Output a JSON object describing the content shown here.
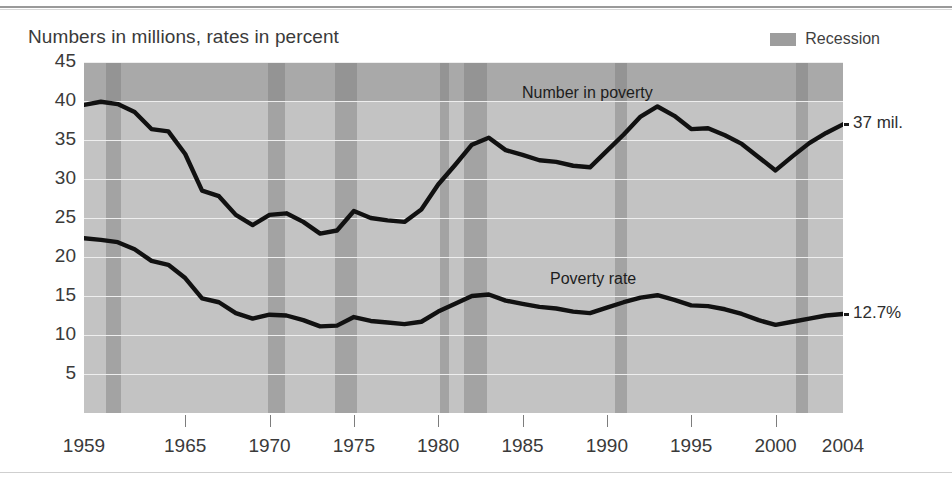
{
  "figure": {
    "subtitle": "Numbers in millions, rates in percent"
  },
  "legend": {
    "recession_label": "Recession",
    "recession_color": "#9d9d9d"
  },
  "annotations": {
    "number_in_poverty": "Number in poverty",
    "poverty_rate": "Poverty rate",
    "end_number": "37 mil.",
    "end_rate": "12.7%"
  },
  "chart_data": {
    "type": "line",
    "title": "",
    "subtitle": "Numbers in millions, rates in percent",
    "xlabel": "",
    "ylabel": "",
    "xlim": [
      1959,
      2004
    ],
    "ylim": [
      0,
      45
    ],
    "grid": true,
    "legend_position": "top-right",
    "y_ticks": [
      45,
      40,
      35,
      30,
      25,
      20,
      15,
      10,
      5
    ],
    "x_ticks": [
      1959,
      1965,
      1970,
      1975,
      1980,
      1985,
      1990,
      1995,
      2000,
      2004
    ],
    "x": [
      1959,
      1960,
      1961,
      1962,
      1963,
      1964,
      1965,
      1966,
      1967,
      1968,
      1969,
      1970,
      1971,
      1972,
      1973,
      1974,
      1975,
      1976,
      1977,
      1978,
      1979,
      1980,
      1981,
      1982,
      1983,
      1984,
      1985,
      1986,
      1987,
      1988,
      1989,
      1990,
      1991,
      1992,
      1993,
      1994,
      1995,
      1996,
      1997,
      1998,
      1999,
      2000,
      2001,
      2002,
      2003,
      2004
    ],
    "series": [
      {
        "name": "Number in poverty",
        "units": "millions",
        "end_value_label": "37 mil.",
        "values": [
          39.5,
          39.9,
          39.6,
          38.6,
          36.4,
          36.1,
          33.2,
          28.5,
          27.8,
          25.4,
          24.1,
          25.4,
          25.6,
          24.5,
          23.0,
          23.4,
          25.9,
          25.0,
          24.7,
          24.5,
          26.1,
          29.3,
          31.8,
          34.4,
          35.3,
          33.7,
          33.1,
          32.4,
          32.2,
          31.7,
          31.5,
          33.6,
          35.7,
          38.0,
          39.3,
          38.1,
          36.4,
          36.5,
          35.6,
          34.5,
          32.8,
          31.1,
          32.9,
          34.6,
          35.9,
          37.0
        ]
      },
      {
        "name": "Poverty rate",
        "units": "percent",
        "end_value_label": "12.7%",
        "values": [
          22.4,
          22.2,
          21.9,
          21.0,
          19.5,
          19.0,
          17.3,
          14.7,
          14.2,
          12.8,
          12.1,
          12.6,
          12.5,
          11.9,
          11.1,
          11.2,
          12.3,
          11.8,
          11.6,
          11.4,
          11.7,
          13.0,
          14.0,
          15.0,
          15.2,
          14.4,
          14.0,
          13.6,
          13.4,
          13.0,
          12.8,
          13.5,
          14.2,
          14.8,
          15.1,
          14.5,
          13.8,
          13.7,
          13.3,
          12.7,
          11.9,
          11.3,
          11.7,
          12.1,
          12.5,
          12.7
        ]
      }
    ],
    "recessions": [
      {
        "start": 1960.3,
        "end": 1961.2
      },
      {
        "start": 1969.9,
        "end": 1970.9
      },
      {
        "start": 1973.9,
        "end": 1975.2
      },
      {
        "start": 1980.1,
        "end": 1980.6
      },
      {
        "start": 1981.5,
        "end": 1982.9
      },
      {
        "start": 1990.5,
        "end": 1991.2
      },
      {
        "start": 2001.2,
        "end": 2001.9
      }
    ]
  }
}
